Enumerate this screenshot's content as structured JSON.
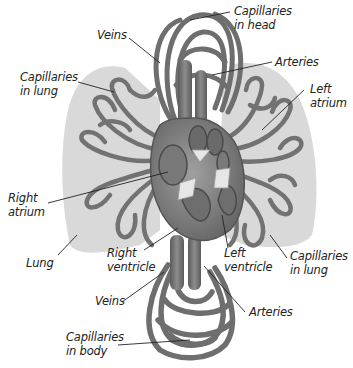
{
  "diagram": {
    "colors": {
      "background": "#ffffff",
      "lung": "#d9d9d9",
      "vessel": "#7a7a7a",
      "vessel_dark": "#4a4a4a",
      "heart": "#8a8a8a",
      "valve": "#e6e6e6",
      "leader_line": "#222222",
      "text": "#222222"
    },
    "labels": {
      "veins_top": "Veins",
      "capillaries_head": "Capillaries\nin head",
      "arteries_top": "Arteries",
      "capillaries_lung_left": "Capillaries\nin lung",
      "left_atrium": "Left\natrium",
      "right_atrium": "Right\natrium",
      "lung": "Lung",
      "right_ventricle": "Right\nventricle",
      "left_ventricle": "Left\nventricle",
      "capillaries_lung_right": "Capillaries\nin lung",
      "veins_bottom": "Veins",
      "arteries_bottom": "Arteries",
      "capillaries_body": "Capillaries\nin body"
    }
  }
}
